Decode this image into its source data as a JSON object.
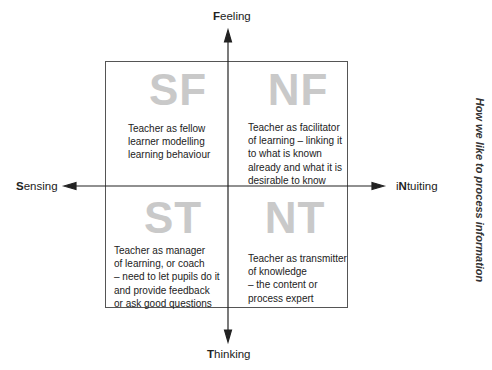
{
  "axes": {
    "top": {
      "initial": "F",
      "rest": "eeling"
    },
    "bottom": {
      "initial": "T",
      "rest": "hinking"
    },
    "left": {
      "initial": "S",
      "rest": "ensing"
    },
    "right": {
      "prefix": "i",
      "initial": "N",
      "rest": "tuiting"
    }
  },
  "side_label": "How we like to process information",
  "quadrants": [
    {
      "code": "SF",
      "text": "Teacher as fellow\nlearner modelling\nlearning behaviour"
    },
    {
      "code": "NF",
      "text": "Teacher as facilitator\nof learning – linking it\nto what is known\nalready and what it is\ndesirable to know"
    },
    {
      "code": "ST",
      "text": "Teacher as manager\nof learning, or coach\n– need to let pupils do it\nand provide feedback\nor ask good questions"
    },
    {
      "code": "NT",
      "text": "Teacher as transmitter\nof knowledge\n– the content or\nprocess expert"
    }
  ],
  "colors": {
    "letters": "#c9c9c9",
    "lines": "#555555",
    "text": "#222222"
  }
}
